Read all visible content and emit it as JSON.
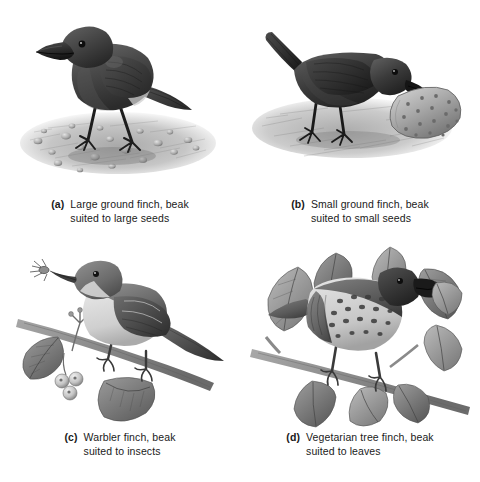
{
  "figure": {
    "background_color": "#ffffff",
    "ink_color": "#333333",
    "layout": "2x2 grid of grayscale scientific illustrations with lettered captions"
  },
  "panels": [
    {
      "key": "a",
      "label": "(a)",
      "caption": "Large ground finch, beak\nsuited to large seeds",
      "species": "Large ground finch",
      "beak": "large, deep, conical crushing beak",
      "food": "large seeds",
      "plumage": "dark blackish-brown",
      "scene": "standing on gravelly ground scattered with round seeds",
      "icon": "large-ground-finch-illustration"
    },
    {
      "key": "b",
      "label": "(b)",
      "caption": "Small ground finch, beak\nsuited to small seeds",
      "species": "Small ground finch",
      "beak": "small conical beak",
      "food": "small seeds",
      "plumage": "dark blackish-brown",
      "scene": "bending down pecking at a spiny cactus pad on the ground",
      "icon": "small-ground-finch-illustration"
    },
    {
      "key": "c",
      "label": "(c)",
      "caption": "Warbler finch, beak\nsuited to insects",
      "species": "Warbler finch",
      "beak": "thin, slender, pointed probing beak",
      "food": "insects",
      "plumage": "olive-grey above, pale cream below",
      "scene": "perched on a berry branch holding an insect in its beak",
      "icon": "warbler-finch-illustration"
    },
    {
      "key": "d",
      "label": "(d)",
      "caption": "Vegetarian tree finch, beak\nsuited to leaves",
      "species": "Vegetarian tree finch",
      "beak": "thick, curved, parrot-like beak",
      "food": "leaves",
      "plumage": "spotted breast, dark head",
      "scene": "perched on a leafy branch biting a leaf",
      "icon": "vegetarian-tree-finch-illustration"
    }
  ]
}
